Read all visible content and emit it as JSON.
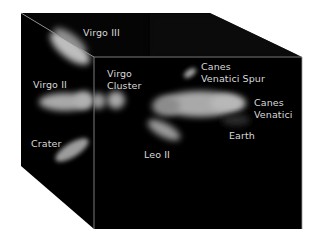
{
  "diagram": {
    "colors": {
      "background": "#ffffff",
      "cube_fill": "#000000",
      "edge": "#9a9a9a",
      "blob": "#c8c8c8",
      "label": "#d8d8d8"
    },
    "labels": [
      {
        "id": "virgo-iii",
        "lines": [
          "Virgo III"
        ]
      },
      {
        "id": "virgo-ii",
        "lines": [
          "Virgo II"
        ]
      },
      {
        "id": "virgo-cluster",
        "lines": [
          "Virgo",
          "Cluster"
        ]
      },
      {
        "id": "canes-venatici-spur",
        "lines": [
          "Canes",
          "Venatici Spur"
        ]
      },
      {
        "id": "canes-venatici",
        "lines": [
          "Canes",
          "Venatici"
        ]
      },
      {
        "id": "earth",
        "lines": [
          "Earth"
        ]
      },
      {
        "id": "leo-ii",
        "lines": [
          "Leo II"
        ]
      },
      {
        "id": "crater",
        "lines": [
          "Crater"
        ]
      }
    ]
  }
}
